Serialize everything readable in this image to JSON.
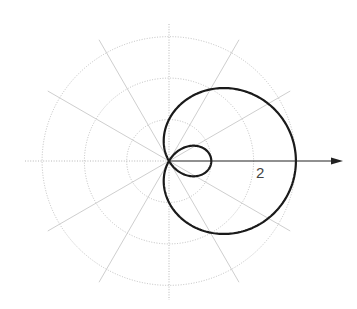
{
  "chart_data": {
    "type": "line",
    "coordinate_system": "polar",
    "title": "",
    "equation": "r = 1 + 2cos(theta)",
    "curve_name": "limacon with inner loop",
    "theta_range": [
      0,
      6.2832
    ],
    "radial_grid": [
      1,
      2,
      3
    ],
    "angular_grid_deg": [
      0,
      30,
      60,
      90,
      120,
      150,
      180,
      210,
      240,
      270,
      300,
      330
    ],
    "polar_axis_label": "2",
    "polar_axis_label_value": 2,
    "key_points": [
      {
        "theta_deg": 0,
        "r": 3
      },
      {
        "theta_deg": 90,
        "r": 1
      },
      {
        "theta_deg": 120,
        "r": 0
      },
      {
        "theta_deg": 180,
        "r": -1
      },
      {
        "theta_deg": 240,
        "r": 0
      },
      {
        "theta_deg": 270,
        "r": 1
      }
    ],
    "grid": true,
    "legend": null
  },
  "layout": {
    "center_x": 169,
    "center_y": 161,
    "unit_px": 42.3,
    "spoke_length_px": 140,
    "axis_left": 25,
    "axis_right": 343,
    "axis_top": 24,
    "axis_bottom": 300,
    "label_x": 256,
    "label_y": 178
  },
  "colors": {
    "curve": "#1a1a1a",
    "grid": "#b8b8b8",
    "axis": "#222222",
    "label": "#444444"
  }
}
